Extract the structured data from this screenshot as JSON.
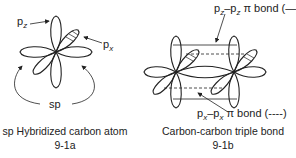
{
  "figure_a": {
    "caption": "sp Hybridized carbon atom",
    "number": "9-1a",
    "labels": {
      "pz_main": "p",
      "pz_sub": "z",
      "px_main": "p",
      "px_sub": "x",
      "sp": "sp"
    }
  },
  "figure_b": {
    "caption": "Carbon-carbon triple bond",
    "number": "9-1b",
    "labels": {
      "pz_bond_main": "p",
      "pz_bond_sub": "z",
      "pz_bond_sep": "–p",
      "pz_bond_sub2": "z",
      "pz_bond_rest": " π bond (—)",
      "px_bond_main": "p",
      "px_bond_sub": "x",
      "px_bond_sep": "–p",
      "px_bond_sub2": "x",
      "px_bond_rest": " π bond (----)"
    }
  },
  "colors": {
    "line": "#222222",
    "background": "#ffffff"
  }
}
